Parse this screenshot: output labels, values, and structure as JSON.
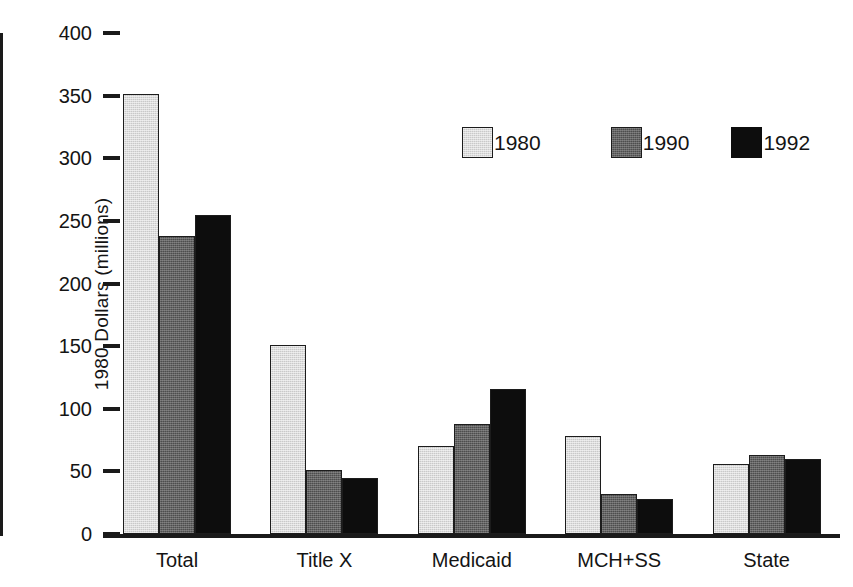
{
  "chart_data": {
    "type": "bar",
    "title": "",
    "xlabel": "",
    "ylabel": "1980 Dollars (millions)",
    "categories": [
      "Total",
      "Title X",
      "Medicaid",
      "MCH+SS",
      "State"
    ],
    "series": [
      {
        "name": "1980",
        "color": "#c9c9c9",
        "values": [
          351,
          151,
          70,
          78,
          56
        ]
      },
      {
        "name": "1990",
        "color": "#4d4d4d",
        "values": [
          238,
          51,
          88,
          32,
          63
        ]
      },
      {
        "name": "1992",
        "color": "#0d0d0d",
        "values": [
          255,
          45,
          116,
          28,
          60
        ]
      }
    ],
    "ylim": [
      0,
      400
    ],
    "yticks": [
      0,
      50,
      100,
      150,
      200,
      250,
      300,
      350,
      400
    ],
    "ytick_labels": [
      "0",
      "50",
      "100",
      "150",
      "200",
      "250",
      "300",
      "350",
      "400"
    ],
    "grid": false,
    "legend_position": "upper-center-right"
  },
  "axes": {
    "y_title": "1980 Dollars (millions)"
  },
  "legend": {
    "entries": [
      {
        "label": "1980"
      },
      {
        "label": "1990"
      },
      {
        "label": "1992"
      }
    ]
  }
}
